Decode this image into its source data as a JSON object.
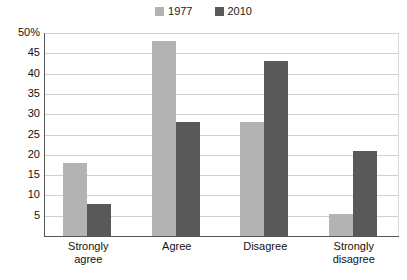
{
  "chart_data": {
    "type": "bar",
    "title": "",
    "subtitle": "",
    "xlabel": "",
    "ylabel": "",
    "categories": [
      "Strongly agree",
      "Agree",
      "Disagree",
      "Strongly disagree"
    ],
    "series": [
      {
        "name": "1977",
        "color": "#b3b3b3",
        "values": [
          18,
          48,
          28,
          5.5
        ]
      },
      {
        "name": "2010",
        "color": "#595959",
        "values": [
          8,
          28,
          43,
          21
        ]
      }
    ],
    "ylim": [
      0,
      50
    ],
    "ytick_labels": [
      "50%",
      "45",
      "40",
      "35",
      "30",
      "25",
      "20",
      "15",
      "10",
      "5"
    ],
    "ytick_values": [
      50,
      45,
      40,
      35,
      30,
      25,
      20,
      15,
      10,
      5
    ],
    "grid": true,
    "grid_axis": "y",
    "legend_position": "top-center"
  },
  "legend": {
    "entries": [
      {
        "label": "1977",
        "swatch_color": "#b3b3b3",
        "swatch_name": "legend-swatch-1977"
      },
      {
        "label": "2010",
        "swatch_color": "#595959",
        "swatch_name": "legend-swatch-2010"
      }
    ]
  },
  "axis": {
    "y_ticks": [
      {
        "label": "50%",
        "value": 50
      },
      {
        "label": "45",
        "value": 45
      },
      {
        "label": "40",
        "value": 40
      },
      {
        "label": "35",
        "value": 35
      },
      {
        "label": "30",
        "value": 30
      },
      {
        "label": "25",
        "value": 25
      },
      {
        "label": "20",
        "value": 20
      },
      {
        "label": "15",
        "value": 15
      },
      {
        "label": "10",
        "value": 10
      },
      {
        "label": "5",
        "value": 5
      }
    ],
    "x_ticks": [
      {
        "line1": "Strongly",
        "line2": "agree"
      },
      {
        "line1": "Agree",
        "line2": ""
      },
      {
        "line1": "Disagree",
        "line2": ""
      },
      {
        "line1": "Strongly",
        "line2": "disagree"
      }
    ]
  },
  "colors": {
    "series_1977": "#b3b3b3",
    "series_2010": "#595959",
    "gridline": "#d0d0d0",
    "axis_line": "#555555",
    "text": "#111111",
    "background": "#ffffff"
  }
}
